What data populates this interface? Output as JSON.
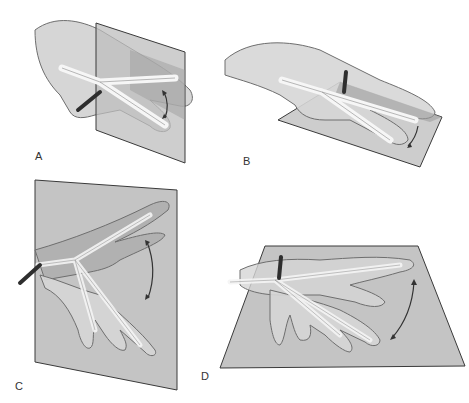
{
  "figure": {
    "colors": {
      "background": "#ffffff",
      "plane": "#c4c4c4",
      "plane_dark": "#a8a8a8",
      "plane_edge": "#3a3a3a",
      "skin": "#d8d8d8",
      "skin_edge": "#6e6e6e",
      "bone": "#f4f4f4",
      "rod": "#2e2e2e",
      "arrow": "#333333",
      "label": "#333333"
    },
    "panels": [
      {
        "id": "A",
        "label": "A",
        "caption": "Vertical plane, lateral view — flexion/extension"
      },
      {
        "id": "B",
        "label": "B",
        "caption": "Horizontal plane under hand — vertical rod"
      },
      {
        "id": "C",
        "label": "C",
        "caption": "Vertical plane, frontal view — flexion/extension sweep"
      },
      {
        "id": "D",
        "label": "D",
        "caption": "Horizontal plane — radial/ulnar deviation"
      }
    ]
  }
}
